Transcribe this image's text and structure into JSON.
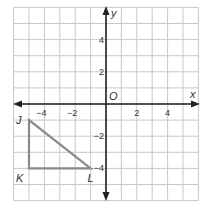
{
  "diagram": {
    "type": "coordinate-plane",
    "x_range": [
      -6,
      6
    ],
    "y_range": [
      -6,
      6
    ],
    "grid_step": 1,
    "axis_labels": {
      "x": "x",
      "y": "y",
      "origin": "O"
    },
    "x_ticks": [
      {
        "value": -4,
        "label": "−4"
      },
      {
        "value": -2,
        "label": "−2"
      },
      {
        "value": 2,
        "label": "2"
      },
      {
        "value": 4,
        "label": "4"
      }
    ],
    "y_ticks": [
      {
        "value": 4,
        "label": "4"
      },
      {
        "value": 2,
        "label": "2"
      },
      {
        "value": -2,
        "label": "−2"
      },
      {
        "value": -4,
        "label": "−4"
      }
    ],
    "triangle": {
      "vertices": [
        {
          "name": "J",
          "x": -5,
          "y": -1
        },
        {
          "name": "K",
          "x": -5,
          "y": -4
        },
        {
          "name": "L",
          "x": -1,
          "y": -4
        }
      ],
      "stroke_color": "#8a8a8a"
    },
    "colors": {
      "grid": "#c8c8c8",
      "axis": "#222222",
      "border": "#bdbdbd"
    }
  }
}
